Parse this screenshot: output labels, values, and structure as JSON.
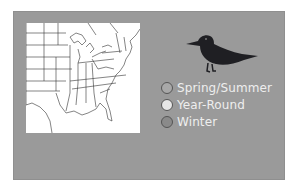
{
  "map": {
    "region": "Eastern United States",
    "legend": [
      {
        "label": "Spring/Summer",
        "color": "#a8a8a8"
      },
      {
        "label": "Year-Round",
        "color": "#e6e6e6"
      },
      {
        "label": "Winter",
        "color": "#8a8a8a"
      }
    ]
  },
  "colors": {
    "panel": "#9a9a9a",
    "map_background": "#ffffff",
    "bird": "#1f1f23"
  }
}
